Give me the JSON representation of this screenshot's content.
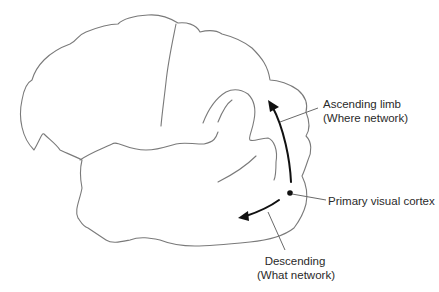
{
  "diagram": {
    "labels": {
      "ascending": {
        "line1": "Ascending limb",
        "line2": "(Where network)"
      },
      "primary": {
        "line1": "Primary visual cortex"
      },
      "descending": {
        "line1": "Descending",
        "line2": "(What network)"
      }
    },
    "colors": {
      "outline": "#7a7a7a",
      "arrow": "#111111",
      "text": "#2a2a2a",
      "background": "#ffffff"
    }
  }
}
